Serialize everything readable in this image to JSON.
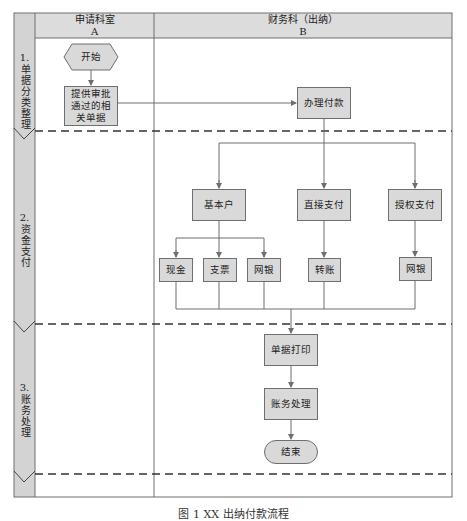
{
  "diagram": {
    "caption": "图 1  XX 出纳付款流程",
    "colors": {
      "frame": "#6f6f6f",
      "header_fill": "#d9d9d9",
      "node_fill": "#d9d9d9",
      "line": "#6f6f6f",
      "dashed": "#333333"
    },
    "lanes": [
      {
        "title": "申请科室",
        "code": "A"
      },
      {
        "title": "财务科（出纳）",
        "code": "B"
      }
    ],
    "phases": [
      {
        "number": "1.",
        "label": "单据分类整理"
      },
      {
        "number": "2.",
        "label": "资金支付"
      },
      {
        "number": "3.",
        "label": "账务处理"
      }
    ],
    "nodes": {
      "start": "开始",
      "submit_docs": "提供审批通过的相关单据",
      "submit_docs_lines": [
        "提供审批",
        "通过的相",
        "关单据"
      ],
      "handle_payment": "办理付款",
      "basic_account": "基本户",
      "direct_payment": "直接支付",
      "authorized_payment": "授权支付",
      "cash": "现金",
      "check": "支票",
      "online_bank_1": "网银",
      "transfer": "转账",
      "online_bank_2": "网银",
      "print_docs": "单据打印",
      "accounting": "账务处理",
      "end": "结束"
    }
  }
}
